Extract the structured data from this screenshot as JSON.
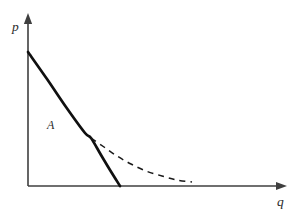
{
  "figure": {
    "background_color": "#ffffff",
    "width": 298,
    "height": 213
  },
  "axes": {
    "color": "#3f3f3f",
    "stroke_width": 1.6,
    "origin": {
      "x": 28,
      "y": 186
    },
    "x_axis": {
      "label": "q",
      "label_x": 277,
      "label_y": 206,
      "start_x": 28,
      "end_x": 281,
      "y": 186,
      "arrow_tip_x": 287
    },
    "y_axis": {
      "label": "p",
      "label_x": 12,
      "label_y": 31,
      "x": 28,
      "start_y": 186,
      "end_y": 20,
      "arrow_tip_y": 13
    }
  },
  "annotations": [
    {
      "name": "region-label-a",
      "text": "A",
      "x": 47,
      "y": 129
    }
  ],
  "chart_data": {
    "type": "line",
    "xlabel": "q",
    "ylabel": "p",
    "grid": false,
    "legend": "none",
    "xlim": [
      0,
      287
    ],
    "ylim": [
      0,
      186
    ],
    "annotations": [
      "A"
    ],
    "series": [
      {
        "name": "solid-demand-segment",
        "style": "solid",
        "color": "#101010",
        "stroke_width": 2.7,
        "dash_pattern": "none",
        "points": [
          [
            28,
            52
          ],
          [
            47,
            79
          ],
          [
            66,
            107
          ],
          [
            85,
            133
          ],
          [
            91,
            138
          ],
          [
            101,
            155
          ],
          [
            110,
            170
          ],
          [
            120,
            186
          ]
        ]
      },
      {
        "name": "dashed-demand-continuation",
        "style": "dashed",
        "color": "#1a1a1a",
        "stroke_width": 1.5,
        "dash_pattern": "6 5",
        "points": [
          [
            91,
            138
          ],
          [
            104,
            147
          ],
          [
            117,
            156
          ],
          [
            131,
            164
          ],
          [
            146,
            171
          ],
          [
            162,
            176
          ],
          [
            177,
            180
          ],
          [
            192,
            182
          ]
        ]
      }
    ]
  }
}
